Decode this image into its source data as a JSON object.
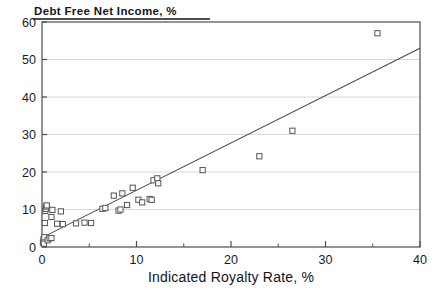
{
  "chart_data": {
    "type": "scatter",
    "title": "Debt Free Net Income, %",
    "xlabel": "Indicated Royalty Rate, %",
    "ylabel": "Debt Free Net Income, %",
    "xlim": [
      0,
      40
    ],
    "ylim": [
      0,
      60
    ],
    "grid": true,
    "legend": null,
    "xticks": [
      0,
      10,
      20,
      30,
      40
    ],
    "xtick_labels": [
      "0",
      "10",
      "20",
      "30",
      "40"
    ],
    "xminor_ticks": [
      5,
      15,
      25,
      35
    ],
    "yticks": [
      0,
      10,
      20,
      30,
      40,
      50,
      60
    ],
    "ytick_labels": [
      "0",
      "10",
      "20",
      "30",
      "40",
      "50",
      "60"
    ],
    "marker": "open-square",
    "marker_color": "#ffffff",
    "marker_edge_color": "#555555",
    "series": [
      {
        "name": "observations",
        "points": [
          [
            0.1,
            1.2
          ],
          [
            0.15,
            2.0
          ],
          [
            0.2,
            0.9
          ],
          [
            0.25,
            2.6
          ],
          [
            0.3,
            6.4
          ],
          [
            0.35,
            9.6
          ],
          [
            0.4,
            10.2
          ],
          [
            0.45,
            10.8
          ],
          [
            0.5,
            11.1
          ],
          [
            0.6,
            1.8
          ],
          [
            0.8,
            2.3
          ],
          [
            1.0,
            2.4
          ],
          [
            1.0,
            8.0
          ],
          [
            1.1,
            9.9
          ],
          [
            1.6,
            6.2
          ],
          [
            2.0,
            9.5
          ],
          [
            2.2,
            6.1
          ],
          [
            3.6,
            6.3
          ],
          [
            4.5,
            6.5
          ],
          [
            5.2,
            6.4
          ],
          [
            6.4,
            10.2
          ],
          [
            6.7,
            10.4
          ],
          [
            7.6,
            13.7
          ],
          [
            8.1,
            9.7
          ],
          [
            8.3,
            10.0
          ],
          [
            8.5,
            14.3
          ],
          [
            9.0,
            11.2
          ],
          [
            9.6,
            15.8
          ],
          [
            10.2,
            12.6
          ],
          [
            10.6,
            11.9
          ],
          [
            11.4,
            12.8
          ],
          [
            11.6,
            12.6
          ],
          [
            11.8,
            17.8
          ],
          [
            12.2,
            18.3
          ],
          [
            12.3,
            17.0
          ],
          [
            17.0,
            20.5
          ],
          [
            23.0,
            24.2
          ],
          [
            26.5,
            31.0
          ],
          [
            35.5,
            57.0
          ]
        ]
      }
    ],
    "trendline": {
      "type": "linear-fit",
      "x0": 0,
      "y0": 2.5,
      "x1": 40,
      "y1": 53.0,
      "color": "#4a4a4a"
    }
  },
  "colors": {
    "frame": "#4d4d4d",
    "grid": "#d8d8d8",
    "text": "#141414",
    "marker_edge": "#5a5a5a",
    "trend": "#4f4f4f"
  }
}
